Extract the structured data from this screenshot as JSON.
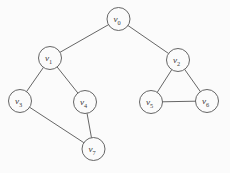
{
  "figure": {
    "width": 230,
    "height": 173,
    "background_color": "#fbfbfb",
    "stroke_color": "#555555",
    "label_color": "#3a3a3a"
  },
  "graph_data": {
    "type": "diagram",
    "graph_kind": "undirected-graph",
    "node_radius": 11.5,
    "nodes": [
      {
        "id": "v0",
        "label_base": "v",
        "label_sub": "0",
        "label": "v0",
        "cx": 118.5,
        "cy": 19
      },
      {
        "id": "v1",
        "label_base": "v",
        "label_sub": "1",
        "label": "v1",
        "cx": 50,
        "cy": 58
      },
      {
        "id": "v2",
        "label_base": "v",
        "label_sub": "2",
        "label": "v2",
        "cx": 178,
        "cy": 60
      },
      {
        "id": "v3",
        "label_base": "v",
        "label_sub": "3",
        "label": "v3",
        "cx": 20,
        "cy": 101
      },
      {
        "id": "v4",
        "label_base": "v",
        "label_sub": "4",
        "label": "v4",
        "cx": 85,
        "cy": 102
      },
      {
        "id": "v5",
        "label_base": "v",
        "label_sub": "5",
        "label": "v5",
        "cx": 151,
        "cy": 102
      },
      {
        "id": "v6",
        "label_base": "v",
        "label_sub": "6",
        "label": "v6",
        "cx": 207,
        "cy": 101
      },
      {
        "id": "v7",
        "label_base": "v",
        "label_sub": "7",
        "label": "v7",
        "cx": 93.5,
        "cy": 149
      }
    ],
    "edges": [
      {
        "source": "v0",
        "target": "v1"
      },
      {
        "source": "v0",
        "target": "v2"
      },
      {
        "source": "v1",
        "target": "v3"
      },
      {
        "source": "v1",
        "target": "v4"
      },
      {
        "source": "v3",
        "target": "v7"
      },
      {
        "source": "v4",
        "target": "v7"
      },
      {
        "source": "v2",
        "target": "v5"
      },
      {
        "source": "v2",
        "target": "v6"
      },
      {
        "source": "v5",
        "target": "v6"
      }
    ]
  }
}
